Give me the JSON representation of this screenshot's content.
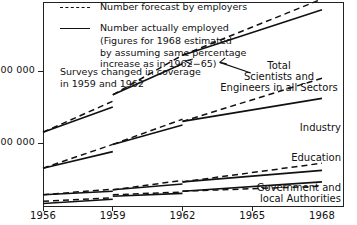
{
  "legend": {
    "items": [
      {
        "style": "dashed",
        "label": "Number forecast by employers"
      },
      {
        "style": "solid",
        "label": "Number actually employed"
      }
    ],
    "continuation": [
      "(Figures for 1968 estimated",
      "by assuming same percentage",
      "increase as in 1962−65)"
    ]
  },
  "note": [
    "Surveys changed in coverage",
    "in 1959 and 1962"
  ],
  "series_labels": [
    {
      "name": "total",
      "lines": [
        "Total",
        "Scientists and",
        "Engineers in all Sectors"
      ]
    },
    {
      "name": "industry",
      "lines": [
        "Industry"
      ]
    },
    {
      "name": "education",
      "lines": [
        "Education"
      ]
    },
    {
      "name": "government",
      "lines": [
        "Government and",
        "local Authorities"
      ]
    }
  ],
  "chart_data": {
    "type": "line",
    "title": "",
    "xlabel": "",
    "ylabel": "",
    "xlim": [
      1956,
      1968
    ],
    "ylim": [
      0,
      290000
    ],
    "grid": false,
    "legend_position": "top-left",
    "x_ticks": [
      1956,
      1959,
      1962,
      1965,
      1968
    ],
    "x_tick_labels": [
      "1956",
      "1959",
      "1962",
      "1965",
      "1968"
    ],
    "y_ticks": [
      100000,
      200000
    ],
    "y_tick_labels": [
      "100 000",
      "200 000"
    ],
    "annotations": [
      {
        "text": "Surveys changed in coverage in 1959 and 1962",
        "x": 1957,
        "y": 205000
      },
      {
        "text": "Total Scientists and Engineers in all Sectors",
        "x": 1965.2,
        "y": 200000,
        "arrow_to": {
          "x": 1963.6,
          "y": 212000
        }
      },
      {
        "text": "Industry",
        "x": 1967.2,
        "y": 120000
      },
      {
        "text": "Education",
        "x": 1966.5,
        "y": 73000
      },
      {
        "text": "Government and local Authorities",
        "x": 1966.6,
        "y": 33000
      }
    ],
    "series": [
      {
        "name": "Total Scientists and Engineers in all Sectors",
        "actual": [
          {
            "segment": "1956-1959",
            "points": [
              [
                1956,
                115000
              ],
              [
                1959,
                150000
              ]
            ]
          },
          {
            "segment": "1959-1962",
            "points": [
              [
                1959,
                167000
              ],
              [
                1962,
                210000
              ]
            ]
          },
          {
            "segment": "1962-1968",
            "points": [
              [
                1962,
                222000
              ],
              [
                1968,
                285000
              ]
            ]
          }
        ],
        "forecast": [
          {
            "segment": "1956-1959",
            "points": [
              [
                1956,
                115000
              ],
              [
                1959,
                158000
              ]
            ]
          },
          {
            "segment": "1959-1962",
            "points": [
              [
                1959,
                167000
              ],
              [
                1962,
                222000
              ]
            ]
          },
          {
            "segment": "1962-1968",
            "points": [
              [
                1962,
                222000
              ],
              [
                1968,
                300000
              ]
            ]
          }
        ]
      },
      {
        "name": "Industry",
        "actual": [
          {
            "segment": "1956-1959",
            "points": [
              [
                1956,
                65000
              ],
              [
                1959,
                88000
              ]
            ]
          },
          {
            "segment": "1959-1962",
            "points": [
              [
                1959,
                98000
              ],
              [
                1962,
                125000
              ]
            ]
          },
          {
            "segment": "1962-1968",
            "points": [
              [
                1962,
                130000
              ],
              [
                1968,
                162000
              ]
            ]
          }
        ],
        "forecast": [
          {
            "segment": "1956-1959",
            "points": [
              [
                1956,
                65000
              ],
              [
                1959,
                98000
              ]
            ]
          },
          {
            "segment": "1959-1962",
            "points": [
              [
                1959,
                98000
              ],
              [
                1962,
                133000
              ]
            ]
          },
          {
            "segment": "1962-1968",
            "points": [
              [
                1962,
                130000
              ],
              [
                1968,
                190000
              ]
            ]
          }
        ]
      },
      {
        "name": "Education",
        "actual": [
          {
            "segment": "1956-1959",
            "points": [
              [
                1956,
                28000
              ],
              [
                1959,
                33000
              ]
            ]
          },
          {
            "segment": "1959-1962",
            "points": [
              [
                1959,
                35000
              ],
              [
                1962,
                43000
              ]
            ]
          },
          {
            "segment": "1962-1968",
            "points": [
              [
                1962,
                46000
              ],
              [
                1968,
                62000
              ]
            ]
          }
        ],
        "forecast": [
          {
            "segment": "1956-1959",
            "points": [
              [
                1956,
                28000
              ],
              [
                1959,
                36000
              ]
            ]
          },
          {
            "segment": "1959-1962",
            "points": [
              [
                1959,
                35000
              ],
              [
                1962,
                48000
              ]
            ]
          },
          {
            "segment": "1962-1968",
            "points": [
              [
                1962,
                46000
              ],
              [
                1968,
                72000
              ]
            ]
          }
        ]
      },
      {
        "name": "Government and local Authorities",
        "actual": [
          {
            "segment": "1956-1959",
            "points": [
              [
                1956,
                16000
              ],
              [
                1959,
                22000
              ]
            ]
          },
          {
            "segment": "1959-1962",
            "points": [
              [
                1959,
                26000
              ],
              [
                1962,
                30000
              ]
            ]
          },
          {
            "segment": "1962-1968",
            "points": [
              [
                1962,
                33000
              ],
              [
                1968,
                46000
              ]
            ]
          }
        ],
        "forecast": [
          {
            "segment": "1956-1959",
            "points": [
              [
                1956,
                19000
              ],
              [
                1959,
                24000
              ]
            ]
          },
          {
            "segment": "1959-1962",
            "points": [
              [
                1959,
                28000
              ],
              [
                1962,
                32000
              ]
            ]
          },
          {
            "segment": "1962-1968",
            "points": [
              [
                1962,
                33000
              ],
              [
                1968,
                40000
              ]
            ]
          }
        ]
      }
    ]
  }
}
